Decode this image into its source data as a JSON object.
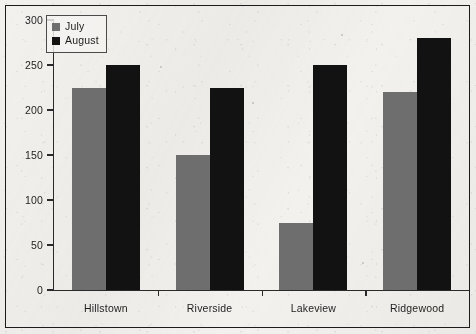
{
  "chart_data": {
    "type": "bar",
    "title": "",
    "subtitle": "",
    "xlabel": "",
    "ylabel": "",
    "categories": [
      "Hillstown",
      "Riverside",
      "Lakeview",
      "Ridgewood"
    ],
    "series": [
      {
        "name": "July",
        "color": "#6e6e6e",
        "values": [
          225,
          150,
          75,
          220
        ]
      },
      {
        "name": "August",
        "color": "#121212",
        "values": [
          250,
          225,
          250,
          280
        ]
      }
    ],
    "ylim": [
      0,
      300
    ],
    "ytick_step": 50,
    "ytick_labels": [
      "0",
      "50",
      "100",
      "150",
      "200",
      "250",
      "300"
    ],
    "grid": false,
    "legend_position": "top-left",
    "annotations": []
  },
  "legend": {
    "items": [
      {
        "label": "July",
        "swatch": "july-swatch"
      },
      {
        "label": "August",
        "swatch": "august-swatch"
      }
    ]
  },
  "axes": {
    "y_ticks": [
      {
        "value": 300,
        "label": "300"
      },
      {
        "value": 250,
        "label": "250"
      },
      {
        "value": 200,
        "label": "200"
      },
      {
        "value": 150,
        "label": "150"
      },
      {
        "value": 100,
        "label": "100"
      },
      {
        "value": 50,
        "label": "50"
      },
      {
        "value": 0,
        "label": "0"
      }
    ],
    "x_categories": [
      "Hillstown",
      "Riverside",
      "Lakeview",
      "Ridgewood"
    ]
  },
  "colors": {
    "july": "#6e6e6e",
    "august": "#121212",
    "axis": "#2a2a2a",
    "frame": "#1c1c1c",
    "paper": "#f2f1ee",
    "text": "#1e1e1e"
  }
}
